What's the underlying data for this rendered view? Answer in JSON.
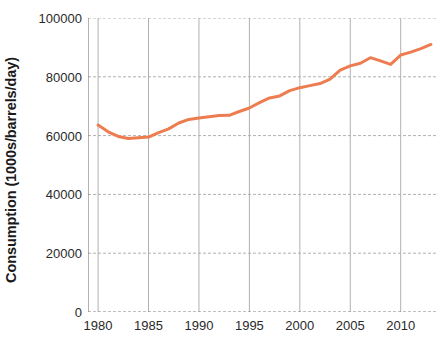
{
  "chart_data": {
    "type": "line",
    "title": "",
    "xlabel": "",
    "ylabel": "Consumption (1000s/barrels/day)",
    "xlim": [
      1979,
      2013.5
    ],
    "ylim": [
      0,
      100000
    ],
    "xticks": [
      1980,
      1985,
      1990,
      1995,
      2000,
      2005,
      2010
    ],
    "xtick_labels": [
      "1980",
      "1985",
      "1990",
      "1995",
      "2000",
      "2005",
      "2010"
    ],
    "yticks": [
      0,
      20000,
      40000,
      60000,
      80000,
      100000
    ],
    "ytick_labels": [
      "0",
      "20000",
      "40000",
      "60000",
      "80000",
      "100000"
    ],
    "grid": true,
    "grid_color": "#b0b0b0",
    "axis_color": "#808080",
    "legend": null,
    "series": [
      {
        "name": "World oil consumption",
        "color": "#ED7D50",
        "line_width": 3,
        "x": [
          1980,
          1981,
          1982,
          1983,
          1984,
          1985,
          1986,
          1987,
          1988,
          1989,
          1990,
          1991,
          1992,
          1993,
          1994,
          1995,
          1996,
          1997,
          1998,
          1999,
          2000,
          2001,
          2002,
          2003,
          2004,
          2005,
          2006,
          2007,
          2008,
          2009,
          2010,
          2011,
          2012,
          2013
        ],
        "values": [
          63600,
          61300,
          59700,
          59000,
          59300,
          59500,
          61000,
          62300,
          64300,
          65500,
          66000,
          66400,
          66800,
          66900,
          68200,
          69400,
          71200,
          72800,
          73500,
          75300,
          76300,
          77000,
          77700,
          79200,
          82300,
          83700,
          84600,
          86500,
          85400,
          84200,
          87400,
          88400,
          89600,
          91000
        ]
      }
    ]
  },
  "axes": {
    "ylabel_text": "Consumption (1000s/barrels/day)"
  }
}
